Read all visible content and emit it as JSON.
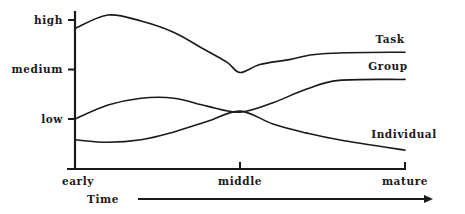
{
  "chart_data": {
    "type": "line",
    "title": "",
    "xlabel": "Time",
    "ylabel": "",
    "x_ticks": [
      {
        "value": 0,
        "label": "early"
      },
      {
        "value": 0.5,
        "label": "middle"
      },
      {
        "value": 1,
        "label": "mature"
      }
    ],
    "y_ticks": [
      {
        "value": 1,
        "label": "low"
      },
      {
        "value": 2,
        "label": "medium"
      },
      {
        "value": 3,
        "label": "high"
      }
    ],
    "xlim": [
      0,
      1
    ],
    "ylim": [
      0,
      3.2
    ],
    "grid": false,
    "legend": "inline-labels-right",
    "series": [
      {
        "name": "Task",
        "x": [
          0,
          0.1,
          0.2,
          0.3,
          0.38,
          0.46,
          0.5,
          0.56,
          0.65,
          0.75,
          1
        ],
        "values": [
          2.83,
          3.1,
          2.98,
          2.75,
          2.45,
          2.15,
          1.94,
          2.1,
          2.2,
          2.32,
          2.35
        ]
      },
      {
        "name": "Group",
        "x": [
          0,
          0.1,
          0.2,
          0.3,
          0.4,
          0.5,
          0.6,
          0.7,
          0.8,
          1
        ],
        "values": [
          1.0,
          1.28,
          1.42,
          1.42,
          1.26,
          1.14,
          1.33,
          1.6,
          1.78,
          1.8
        ]
      },
      {
        "name": "Individual",
        "x": [
          0,
          0.1,
          0.2,
          0.3,
          0.4,
          0.5,
          0.6,
          0.7,
          0.8,
          1
        ],
        "values": [
          0.58,
          0.53,
          0.58,
          0.74,
          0.95,
          1.16,
          0.9,
          0.72,
          0.58,
          0.37
        ]
      }
    ]
  }
}
